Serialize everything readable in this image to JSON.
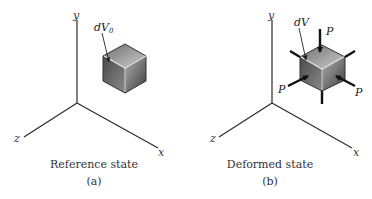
{
  "figure": {
    "panels": [
      {
        "id": "a",
        "axes": {
          "x": "x",
          "y": "y",
          "z": "z"
        },
        "element_label": "dV",
        "element_subscript": "0",
        "title": "Reference state",
        "tag": "(a)"
      },
      {
        "id": "b",
        "axes": {
          "x": "x",
          "y": "y",
          "z": "z"
        },
        "element_label": "dV",
        "load_labels": [
          "P",
          "P",
          "P"
        ],
        "title": "Deformed state",
        "tag": "(b)"
      }
    ],
    "colors": {
      "axis": "#2b2b2b",
      "cube_top": "#9a9a9a",
      "cube_left": "#5e5e5e",
      "cube_right": "#7a7a7a",
      "highlight": "#f2f2f2",
      "background": "#ffffff"
    }
  }
}
